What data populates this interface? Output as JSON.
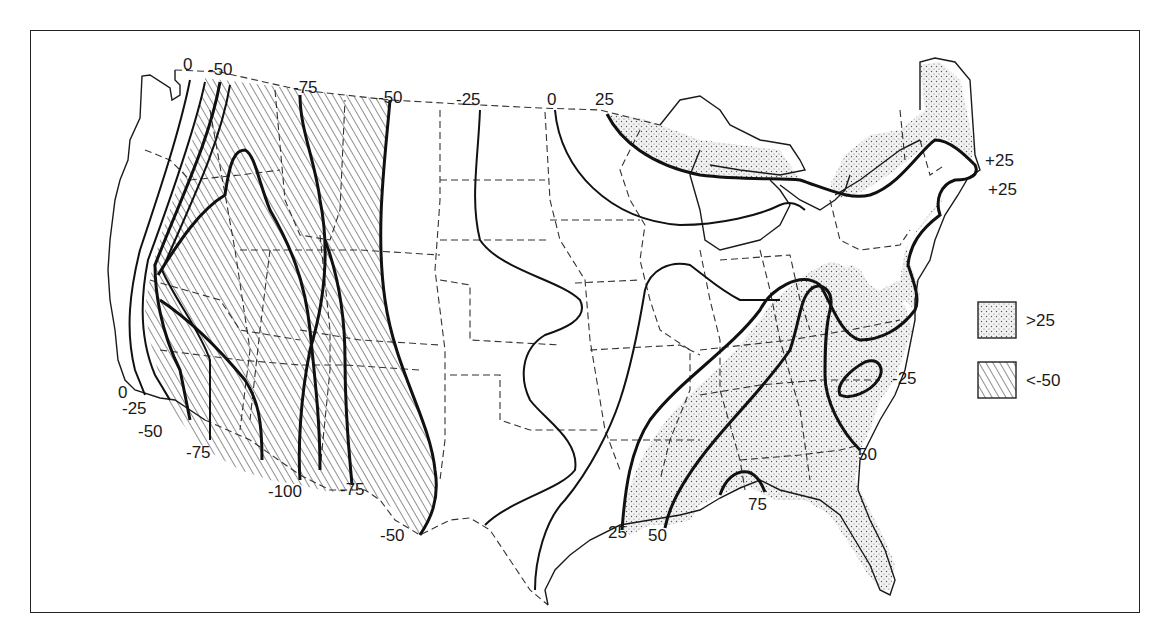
{
  "map": {
    "type": "contour-map",
    "region": "Contiguous United States",
    "contour_labels": [
      {
        "text": "0",
        "x": 183,
        "y": 70
      },
      {
        "text": "-50",
        "x": 210,
        "y": 75
      },
      {
        "text": "-75",
        "x": 300,
        "y": 93
      },
      {
        "text": "-50",
        "x": 380,
        "y": 103
      },
      {
        "text": "-25",
        "x": 458,
        "y": 105
      },
      {
        "text": "0",
        "x": 548,
        "y": 105
      },
      {
        "text": "25",
        "x": 597,
        "y": 105
      },
      {
        "text": "+25",
        "x": 985,
        "y": 166
      },
      {
        "text": "+25",
        "x": 985,
        "y": 195
      },
      {
        "text": "0",
        "x": 118,
        "y": 398
      },
      {
        "text": "-25",
        "x": 124,
        "y": 415
      },
      {
        "text": "-50",
        "x": 138,
        "y": 438
      },
      {
        "text": "-75",
        "x": 186,
        "y": 460
      },
      {
        "text": "-100",
        "x": 268,
        "y": 497
      },
      {
        "text": "-75",
        "x": 342,
        "y": 495
      },
      {
        "text": "-50",
        "x": 382,
        "y": 541
      },
      {
        "text": "-25",
        "x": 890,
        "y": 384
      },
      {
        "text": "50",
        "x": 858,
        "y": 460
      },
      {
        "text": "75",
        "x": 748,
        "y": 510
      },
      {
        "text": "25",
        "x": 608,
        "y": 538
      },
      {
        "text": "50",
        "x": 648,
        "y": 541
      }
    ]
  },
  "legend": {
    "items": [
      {
        "pattern": "stipple",
        "label": ">25"
      },
      {
        "pattern": "hatch",
        "label": "<-50"
      }
    ]
  }
}
